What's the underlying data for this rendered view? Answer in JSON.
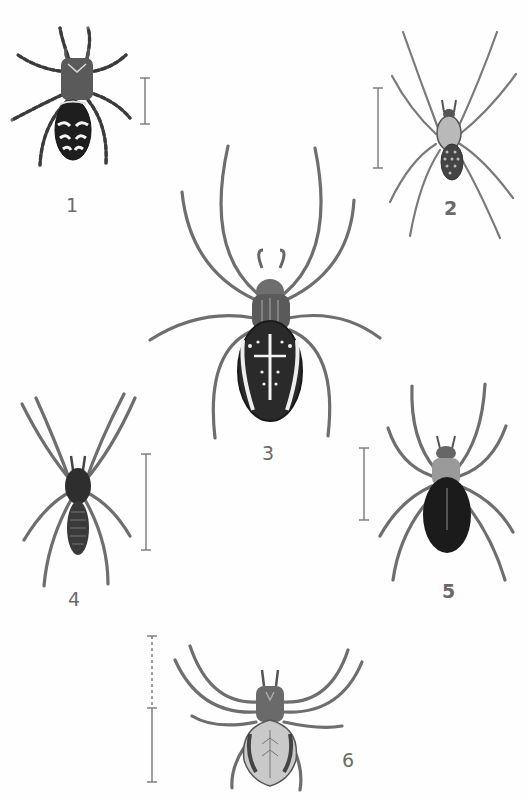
{
  "plate": {
    "type": "scientific illustration plate",
    "subject": "spiders (dorsal views)",
    "background": "#fefefe"
  },
  "figures": [
    {
      "label": "1",
      "description": "small spider with dark abdomen and white chevron bands",
      "scale_bar": "solid"
    },
    {
      "label": "2",
      "description": "long-legged slender spider with spotted abdomen",
      "scale_bar": "solid"
    },
    {
      "label": "3",
      "description": "orb-weaver spider with cross-patterned oval abdomen",
      "scale_bar": "none"
    },
    {
      "label": "4",
      "description": "dark elongated spider with segmented abdomen",
      "scale_bar": "solid"
    },
    {
      "label": "5",
      "description": "spider with glossy dark oval abdomen",
      "scale_bar": "solid"
    },
    {
      "label": "6",
      "description": "crab-like spider with pale abdomen and dark side bands",
      "scale_bar": "dashed + solid"
    }
  ]
}
